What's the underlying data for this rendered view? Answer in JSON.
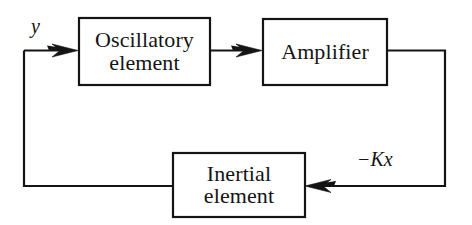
{
  "diagram": {
    "type": "block-diagram",
    "background_color": "#ffffff",
    "stroke_color": "#141414",
    "text_color": "#141414",
    "blocks": [
      {
        "id": "oscillatory",
        "label_line1": "Oscillatory",
        "label_line2": "element",
        "x": 78,
        "y": 17,
        "width": 133,
        "height": 69
      },
      {
        "id": "amplifier",
        "label_line1": "Amplifier",
        "label_line2": "",
        "x": 262,
        "y": 18,
        "width": 126,
        "height": 68
      },
      {
        "id": "inertial",
        "label_line1": "Inertial",
        "label_line2": "element",
        "x": 172,
        "y": 152,
        "width": 134,
        "height": 66
      }
    ],
    "signal_labels": [
      {
        "id": "input-y",
        "text": "y",
        "x": 31,
        "y": 15
      },
      {
        "id": "feedback-kx",
        "text": "−Kx",
        "x": 357,
        "y": 148
      }
    ],
    "connections": [
      {
        "id": "input-to-oscillatory",
        "from": "feedback-riser-left",
        "to": "oscillatory",
        "direction": "right",
        "arrowhead": true
      },
      {
        "id": "oscillatory-to-amplifier",
        "from": "oscillatory",
        "to": "amplifier",
        "direction": "right",
        "arrowhead": true
      },
      {
        "id": "amplifier-to-inertial",
        "from": "amplifier",
        "to": "inertial",
        "direction": "left",
        "arrowhead": true
      },
      {
        "id": "inertial-to-input",
        "from": "inertial",
        "to": "input-y",
        "direction": "left",
        "arrowhead": false
      }
    ]
  }
}
